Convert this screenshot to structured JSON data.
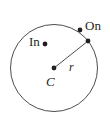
{
  "figure": {
    "name": "circle-radius-diagram",
    "background_color": "#ffffff",
    "stroke_color": "#4d4d4f",
    "dot_color": "#231f20",
    "text_color": "#231f20",
    "circle": {
      "center_x": 54,
      "center_y": 68,
      "radius": 43.5,
      "stroke_width": 1
    },
    "radius_line": {
      "x1": 54,
      "y1": 68,
      "x2": 88,
      "y2": 41,
      "stroke_width": 1
    },
    "points": [
      {
        "name": "center-point",
        "x": 54,
        "y": 68,
        "r": 2.4
      },
      {
        "name": "inside-point",
        "x": 45,
        "y": 44,
        "r": 2.4
      },
      {
        "name": "on-circle-point",
        "x": 80,
        "y": 30,
        "r": 2.4
      },
      {
        "name": "radius-endpoint",
        "x": 88,
        "y": 41,
        "r": 2.4
      }
    ],
    "labels": {
      "on": "On",
      "in": "In",
      "center": "C",
      "radius": "r"
    }
  }
}
